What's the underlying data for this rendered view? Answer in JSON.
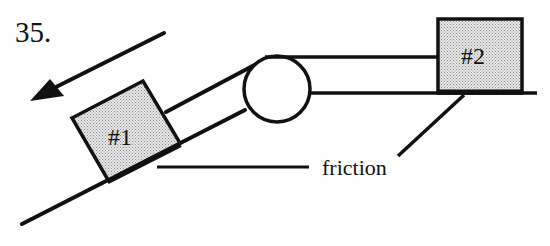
{
  "problem": {
    "number": "35."
  },
  "diagram": {
    "block1": {
      "label": "#1"
    },
    "block2": {
      "label": "#2"
    },
    "friction_label": "friction",
    "colors": {
      "stroke": "#111111",
      "block_fill": "#e4e4e4",
      "block_dots": "#8a8a8a",
      "background": "#ffffff"
    },
    "elements": {
      "motion_arrow": "arrow pointing down the incline (left-down)",
      "pulley": "circle at top of incline",
      "incline": "inclined surface",
      "table": "horizontal surface under block #2"
    }
  }
}
